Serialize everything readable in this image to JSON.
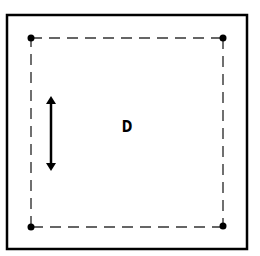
{
  "diagram": {
    "label": "D",
    "colors": {
      "stroke": "#000000",
      "dash": "#333333",
      "background": "#ffffff"
    },
    "outer_frame": {
      "x": 6,
      "y": 14,
      "width": 242,
      "height": 236
    },
    "dashed_square": {
      "corners": [
        {
          "name": "top-left",
          "x": 31,
          "y": 38
        },
        {
          "name": "top-right",
          "x": 223,
          "y": 38
        },
        {
          "name": "bottom-right",
          "x": 223,
          "y": 227
        },
        {
          "name": "bottom-left",
          "x": 31,
          "y": 227
        }
      ]
    },
    "arrow": {
      "orientation": "vertical",
      "double_headed": true,
      "x": 51,
      "y1": 93,
      "y2": 174
    }
  }
}
